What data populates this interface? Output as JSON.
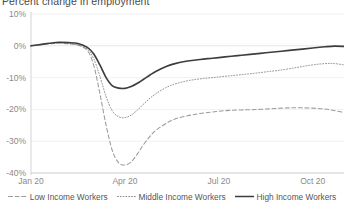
{
  "chart_data": {
    "type": "line",
    "title": "Percent change in employment",
    "xlabel": "",
    "ylabel": "",
    "ylim": [
      -40,
      10
    ],
    "xlim": [
      0,
      10
    ],
    "grid": false,
    "legend_position": "bottom",
    "y_ticks": [
      "10%",
      "0%",
      "-10%",
      "-20%",
      "-30%",
      "-40%"
    ],
    "y_tick_values": [
      10,
      0,
      -10,
      -20,
      -30,
      -40
    ],
    "x_ticks": [
      "Jan 20",
      "Apr 20",
      "Jul 20",
      "Oct 20"
    ],
    "x_tick_values": [
      0,
      3,
      6,
      9
    ],
    "series": [
      {
        "name": "Low Income Workers",
        "style": "dashed",
        "color": "#9b9b9b",
        "x": [
          0,
          0.3,
          0.6,
          0.9,
          1.2,
          1.5,
          1.8,
          2.0,
          2.2,
          2.4,
          2.6,
          2.8,
          3.0,
          3.2,
          3.4,
          3.6,
          3.8,
          4.0,
          4.3,
          4.6,
          5.0,
          5.4,
          5.8,
          6.2,
          6.6,
          7.0,
          7.5,
          8.0,
          8.5,
          9.0,
          9.4,
          9.7,
          10.0
        ],
        "values": [
          0,
          0.3,
          0.6,
          0.8,
          0.6,
          0.2,
          -1.5,
          -6,
          -15,
          -25,
          -33,
          -36.8,
          -37.5,
          -36.5,
          -34,
          -31,
          -28.5,
          -26.5,
          -24.5,
          -23,
          -22,
          -21.3,
          -20.8,
          -20.4,
          -20.2,
          -20.1,
          -19.9,
          -19.6,
          -19.5,
          -19.6,
          -19.9,
          -20.4,
          -21.0
        ]
      },
      {
        "name": "Middle Income Workers",
        "style": "dotted",
        "color": "#8c8c8c",
        "x": [
          0,
          0.3,
          0.6,
          0.9,
          1.2,
          1.5,
          1.8,
          2.0,
          2.2,
          2.4,
          2.6,
          2.8,
          3.0,
          3.2,
          3.4,
          3.6,
          3.8,
          4.0,
          4.3,
          4.6,
          5.0,
          5.4,
          5.8,
          6.2,
          6.6,
          7.0,
          7.5,
          8.0,
          8.5,
          9.0,
          9.4,
          9.7,
          10.0
        ],
        "values": [
          0,
          0.3,
          0.7,
          0.9,
          0.7,
          0.3,
          -1.0,
          -4,
          -9.5,
          -16,
          -20.5,
          -22.3,
          -22.6,
          -21.8,
          -20.2,
          -18.3,
          -16.5,
          -15.0,
          -13.2,
          -12.0,
          -11.0,
          -10.4,
          -10.0,
          -9.6,
          -9.2,
          -8.8,
          -8.2,
          -7.6,
          -6.8,
          -6.0,
          -5.6,
          -5.6,
          -6.0
        ]
      },
      {
        "name": "High Income Workers",
        "style": "solid",
        "color": "#3d3d3d",
        "x": [
          0,
          0.3,
          0.6,
          0.9,
          1.2,
          1.5,
          1.8,
          2.0,
          2.2,
          2.4,
          2.6,
          2.8,
          3.0,
          3.2,
          3.4,
          3.6,
          3.8,
          4.0,
          4.3,
          4.6,
          5.0,
          5.4,
          5.8,
          6.2,
          6.6,
          7.0,
          7.5,
          8.0,
          8.5,
          9.0,
          9.4,
          9.7,
          10.0
        ],
        "values": [
          0,
          0.4,
          0.8,
          1.1,
          1.0,
          0.7,
          -0.5,
          -2.5,
          -6,
          -10,
          -12.6,
          -13.3,
          -13.4,
          -12.8,
          -11.8,
          -10.5,
          -9.2,
          -8.0,
          -6.6,
          -5.6,
          -4.8,
          -4.3,
          -3.9,
          -3.5,
          -3.1,
          -2.7,
          -2.2,
          -1.7,
          -1.2,
          -0.7,
          -0.3,
          -0.1,
          -0.2
        ]
      }
    ]
  }
}
